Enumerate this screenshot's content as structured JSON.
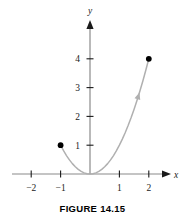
{
  "figure": {
    "caption": "FIGURE 14.15",
    "axis_x_label": "x",
    "axis_y_label": "y"
  },
  "chart_data": {
    "type": "line",
    "title": "",
    "subtitle": "",
    "xlabel": "x",
    "ylabel": "y",
    "function": "y = x^2",
    "grid": false,
    "legend": false,
    "legend_position": "none",
    "xlim": [
      -2.6,
      2.6
    ],
    "ylim": [
      -0.45,
      4.7
    ],
    "xticks": [
      -2,
      -1,
      1,
      2
    ],
    "xtick_labels": [
      "−2",
      "−1",
      "1",
      "2"
    ],
    "yticks": [
      1,
      2,
      3,
      4
    ],
    "ytick_labels": [
      "1",
      "2",
      "3",
      "4"
    ],
    "series": [
      {
        "name": "y = x^2",
        "color": "#b0b0b0",
        "domain": [
          -1,
          2
        ],
        "x": [
          -1.0,
          -0.9,
          -0.8,
          -0.7,
          -0.6,
          -0.5,
          -0.4,
          -0.3,
          -0.2,
          -0.1,
          0.0,
          0.1,
          0.2,
          0.3,
          0.4,
          0.5,
          0.6,
          0.7,
          0.8,
          0.9,
          1.0,
          1.1,
          1.2,
          1.3,
          1.4,
          1.5,
          1.6,
          1.7,
          1.8,
          1.9,
          2.0
        ],
        "values": [
          1.0,
          0.81,
          0.64,
          0.49,
          0.36,
          0.25,
          0.16,
          0.09,
          0.04,
          0.01,
          0.0,
          0.01,
          0.04,
          0.09,
          0.16,
          0.25,
          0.36,
          0.49,
          0.64,
          0.81,
          1.0,
          1.21,
          1.44,
          1.69,
          1.96,
          2.25,
          2.56,
          2.89,
          3.24,
          3.61,
          4.0
        ]
      }
    ],
    "endpoints": [
      {
        "name": "start-point",
        "x": -1,
        "y": 1,
        "style": "filled"
      },
      {
        "name": "end-point",
        "x": 2,
        "y": 4,
        "style": "filled"
      }
    ],
    "annotations": [
      {
        "name": "direction-arrow",
        "x": 1.63,
        "y": 2.66,
        "note": "orientation arrow along curve pointing up-right"
      }
    ]
  },
  "colors": {
    "curve": "#b0b0b0",
    "axis": "#8a8a8a",
    "point": "#000000",
    "text": "#1a1a1a"
  }
}
